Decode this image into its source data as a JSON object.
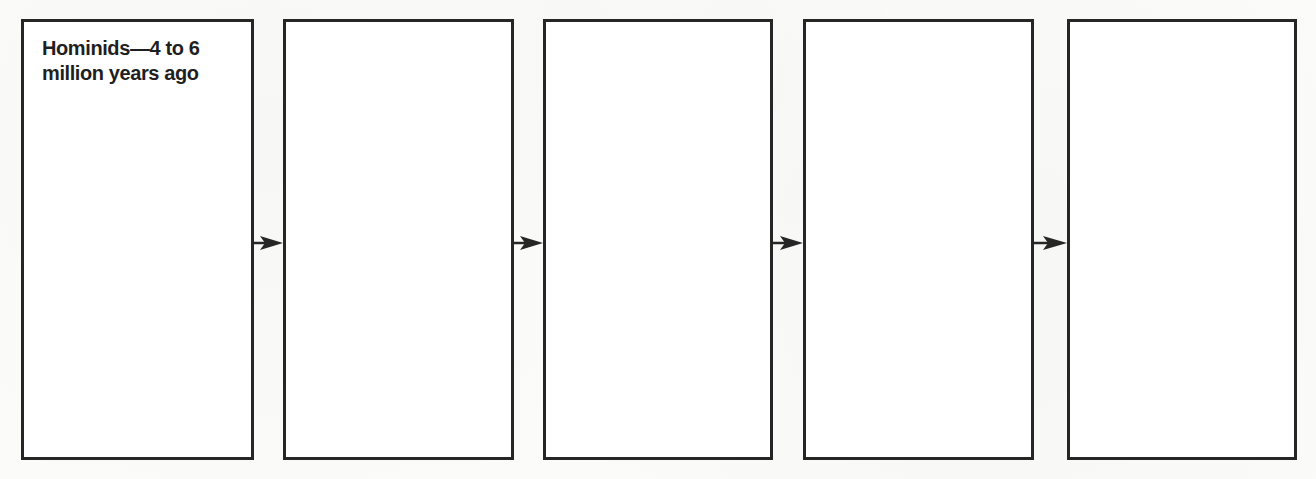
{
  "diagram": {
    "type": "flow-sequence",
    "direction": "left-to-right",
    "stages": [
      {
        "label": "Hominids—4 to 6\nmillion years ago"
      },
      {
        "label": ""
      },
      {
        "label": ""
      },
      {
        "label": ""
      },
      {
        "label": ""
      }
    ],
    "connectors": [
      {
        "from": 0,
        "to": 1,
        "icon": "arrow-right-icon"
      },
      {
        "from": 1,
        "to": 2,
        "icon": "arrow-right-icon"
      },
      {
        "from": 2,
        "to": 3,
        "icon": "arrow-right-icon"
      },
      {
        "from": 3,
        "to": 4,
        "icon": "arrow-right-icon"
      }
    ],
    "colors": {
      "border": "#262626",
      "arrow": "#262626",
      "text": "#1f1f1f",
      "background": "#fbfbfa"
    }
  }
}
